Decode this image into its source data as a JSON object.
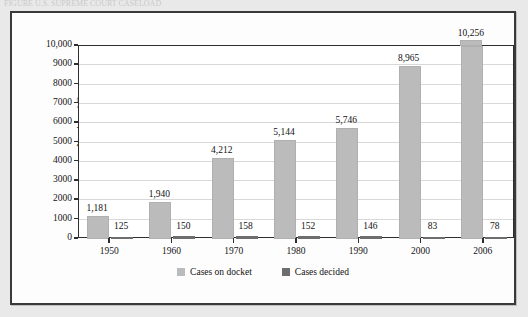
{
  "page": {
    "top_caption": "FIGURE   U.S. SUPREME COURT CASELOAD",
    "background_color": "#e9e9e9"
  },
  "figure": {
    "frame_color": "#3a3a3c",
    "plot_background": "#ffffff"
  },
  "legend": {
    "position": "bottom-center",
    "entries": [
      {
        "label": "Cases on docket",
        "color": "#bbbbbb",
        "swatch": "legend-swatch-docket"
      },
      {
        "label": "Cases decided",
        "color": "#6e6e6e",
        "swatch": "legend-swatch-decided"
      }
    ]
  },
  "chart_data": {
    "type": "bar",
    "title": "",
    "subtitle": "",
    "xlabel": "",
    "ylabel": "Number of Cases",
    "categories": [
      "1950",
      "1960",
      "1970",
      "1980",
      "1990",
      "2000",
      "2006"
    ],
    "series": [
      {
        "name": "Cases on docket",
        "color": "#bbbbbb",
        "values": [
          1181,
          1940,
          4212,
          5144,
          5746,
          8965,
          10256
        ],
        "data_labels": [
          "1,181",
          "1,940",
          "4,212",
          "5,144",
          "5,746",
          "8,965",
          "10,256"
        ]
      },
      {
        "name": "Cases decided",
        "color": "#6e6e6e",
        "values": [
          125,
          150,
          158,
          152,
          146,
          83,
          78
        ],
        "data_labels": [
          "125",
          "150",
          "158",
          "152",
          "146",
          "83",
          "78"
        ]
      }
    ],
    "ylim": [
      0,
      10000
    ],
    "ytick_values": [
      0,
      1000,
      2000,
      3000,
      4000,
      5000,
      6000,
      7000,
      8000,
      9000,
      10000
    ],
    "ytick_labels": [
      "0",
      "1000",
      "2000",
      "3000",
      "4000",
      "5000",
      "6000",
      "7000",
      "8000",
      "9000",
      "10,000"
    ],
    "grid": true,
    "grid_axis": "y",
    "legend_position": "bottom"
  }
}
